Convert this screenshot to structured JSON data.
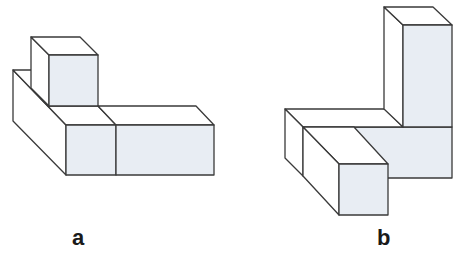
{
  "figures": [
    {
      "id": "a",
      "label": "a",
      "description": "Isometric block assembly: one cube stacked on the back of an L-shaped arrangement of blocks"
    },
    {
      "id": "b",
      "label": "b",
      "description": "Isometric block assembly: tall vertical column with a horizontal slab and a front bar"
    }
  ],
  "colors": {
    "stroke": "#3a3a3a",
    "shaded_face": "#e8edf3",
    "light_face": "#ffffff",
    "background": "#ffffff"
  }
}
